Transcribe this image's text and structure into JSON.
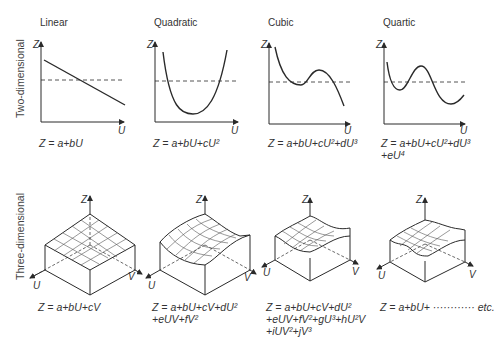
{
  "row_labels": {
    "two_d": "Two-dimensional",
    "three_d": "Three-dimensional"
  },
  "axes": {
    "z": "Z",
    "u": "U",
    "v": "V"
  },
  "two_d": [
    {
      "title": "Linear",
      "eq_lines": [
        "Z = a+bU"
      ]
    },
    {
      "title": "Quadratic",
      "eq_lines": [
        "Z = a+bU+cU²"
      ]
    },
    {
      "title": "Cubic",
      "eq_lines": [
        "Z = a+bU+cU²+dU³"
      ]
    },
    {
      "title": "Quartic",
      "eq_lines": [
        "Z = a+bU+cU²+dU³",
        "+eU⁴"
      ]
    }
  ],
  "three_d": [
    {
      "eq_lines": [
        "Z = a+bU+cV"
      ]
    },
    {
      "eq_lines": [
        "Z = a+bU+cV+dU²",
        "+eUV+fV²"
      ]
    },
    {
      "eq_lines": [
        "Z = a+bU+cV+dU²",
        "+eUV+fV²+gU³+hU²V",
        "+iUV²+jV³"
      ]
    },
    {
      "eq_lines": [
        "Z = a+bU+ ············ etc."
      ]
    }
  ],
  "colors": {
    "line": "#2a2a2a",
    "grid": "#555555",
    "text": "#333333"
  }
}
